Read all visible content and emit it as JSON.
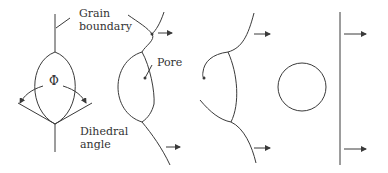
{
  "diagram": {
    "labels": {
      "grain_boundary_line1": "Grain",
      "grain_boundary_line2": "boundary",
      "pore": "Pore",
      "dihedral_line1": "Dihedral",
      "dihedral_line2": "angle",
      "phi": "Φ"
    },
    "stages": [
      {
        "id": 1,
        "description": "Pore on grain boundary with dihedral angle Φ"
      },
      {
        "id": 2,
        "description": "Grain boundary moving, pore dragged"
      },
      {
        "id": 3,
        "description": "Pore near breakaway"
      },
      {
        "id": 4,
        "description": "Isolated spherical pore; boundary separated"
      }
    ],
    "colors": {
      "line": "#3a3a3a",
      "text": "#333333",
      "background": "#ffffff"
    }
  }
}
